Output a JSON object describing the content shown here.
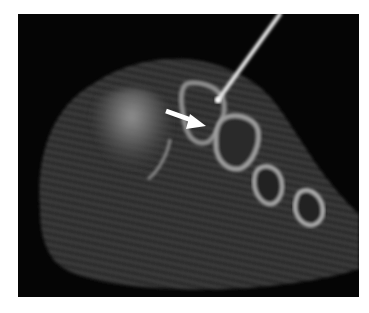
{
  "image": {
    "description": "Axial CT cross-section of a foot with a needle inserted and a white arrow pointing to a metatarsal region",
    "background_color": "#ffffff",
    "frame_color": "#050505",
    "soft_tissue_color": "#3a3a3a",
    "bone_color": "#9a9a9a",
    "needle_color": "#e8e8e8",
    "arrow_color": "#ffffff",
    "annotations": [
      {
        "type": "arrow",
        "direction": "right-down",
        "semantic": "arrow-indicator"
      },
      {
        "type": "needle",
        "semantic": "biopsy-needle"
      }
    ],
    "bones_count": 4
  }
}
